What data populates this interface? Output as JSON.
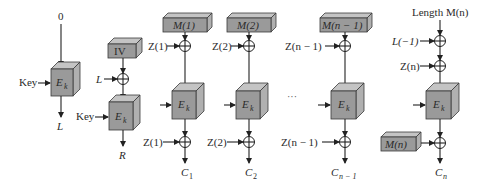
{
  "diagram": {
    "columns": [
      {
        "id": "key-setup",
        "input_top": "0",
        "key_label": "Key",
        "cipher_label": "E",
        "cipher_sub": "k",
        "output": "L"
      },
      {
        "id": "iv-setup",
        "block": "IV",
        "xor_input": "L",
        "key_label": "Key",
        "cipher_label": "E",
        "cipher_sub": "k",
        "output": "R"
      },
      {
        "id": "block-1",
        "block": "M(1)",
        "xor_pre": "Z(1)",
        "cipher_label": "E",
        "cipher_sub": "k",
        "xor_post": "Z(1)",
        "output": "C",
        "output_sub": "1"
      },
      {
        "id": "block-2",
        "block": "M(2)",
        "xor_pre": "Z(2)",
        "cipher_label": "E",
        "cipher_sub": "k",
        "xor_post": "Z(2)",
        "output": "C",
        "output_sub": "2"
      },
      {
        "id": "block-n-minus-1",
        "block": "M(n − 1)",
        "xor_pre": "Z(n − 1)",
        "cipher_label": "E",
        "cipher_sub": "k",
        "xor_post": "Z(n − 1)",
        "output": "C",
        "output_sub": "n − 1"
      },
      {
        "id": "block-n",
        "input_top": "Length M(n)",
        "xor_1": "L(−1)",
        "xor_2": "Z(n)",
        "cipher_label": "E",
        "cipher_sub": "k",
        "xor_post_block": "M(n)",
        "output": "C",
        "output_sub": "n"
      }
    ],
    "ellipsis": "···"
  },
  "colors": {
    "box_front": "#9a9a9a",
    "box_top": "#c4c4c4",
    "box_side": "#b0b0b0",
    "line": "#222222"
  }
}
